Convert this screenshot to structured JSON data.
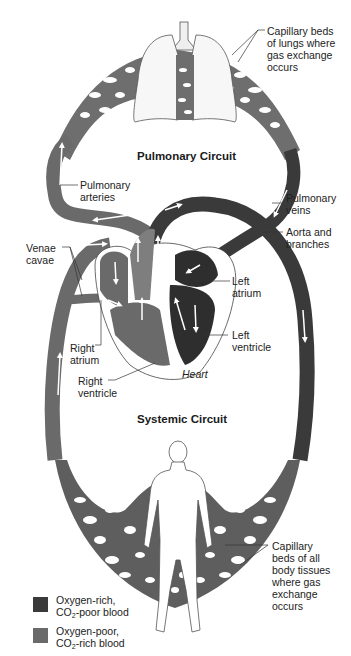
{
  "diagram": {
    "titles": {
      "pulmonary": "Pulmonary Circuit",
      "systemic": "Systemic Circuit",
      "heart": "Heart"
    },
    "labels": {
      "capillary_lungs": "Capillary beds\nof lungs where\ngas exchange\noccurs",
      "pulmonary_arteries": "Pulmonary\narteries",
      "pulmonary_veins": "Pulmonary\nveins",
      "aorta": "Aorta and\nbranches",
      "venae_cavae": "Venae\ncavae",
      "left_atrium": "Left\natrium",
      "left_ventricle": "Left\nventricle",
      "right_atrium": "Right\natrium",
      "right_ventricle": "Right\nventricle",
      "capillary_body": "Capillary\nbeds of all\nbody tissues\nwhere gas\nexchange\noccurs"
    },
    "legend": [
      {
        "line1": "Oxygen-rich,",
        "line2_pre": "CO",
        "line2_sub": "2",
        "line2_post": "-poor blood",
        "color": "#3a3a3a"
      },
      {
        "line1": "Oxygen-poor,",
        "line2_pre": "CO",
        "line2_sub": "2",
        "line2_post": "-rich blood",
        "color": "#6a6a6a"
      }
    ],
    "colors": {
      "oxygen_rich": "#3a3a3a",
      "oxygen_poor": "#6a6a6a",
      "capillary": "#5e5e5e",
      "arrow": "#ffffff"
    }
  }
}
